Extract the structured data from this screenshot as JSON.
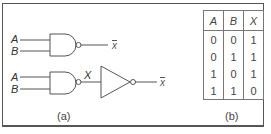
{
  "figure": {
    "panel_a": {
      "caption": "(a)",
      "circuit_1": {
        "gate": "NAND",
        "inputs": [
          "A",
          "B"
        ],
        "output_label": "x"
      },
      "circuit_2": {
        "gates": [
          "NAND",
          "NOT"
        ],
        "inputs": [
          "A",
          "B"
        ],
        "intermediate_label": "X",
        "output_label": "x"
      }
    },
    "panel_b": {
      "caption": "(b)",
      "truth_table": {
        "headers": [
          "A",
          "B",
          "X"
        ],
        "rows": [
          [
            "0",
            "0",
            "1"
          ],
          [
            "0",
            "1",
            "1"
          ],
          [
            "1",
            "0",
            "1"
          ],
          [
            "1",
            "1",
            "0"
          ]
        ]
      }
    }
  }
}
